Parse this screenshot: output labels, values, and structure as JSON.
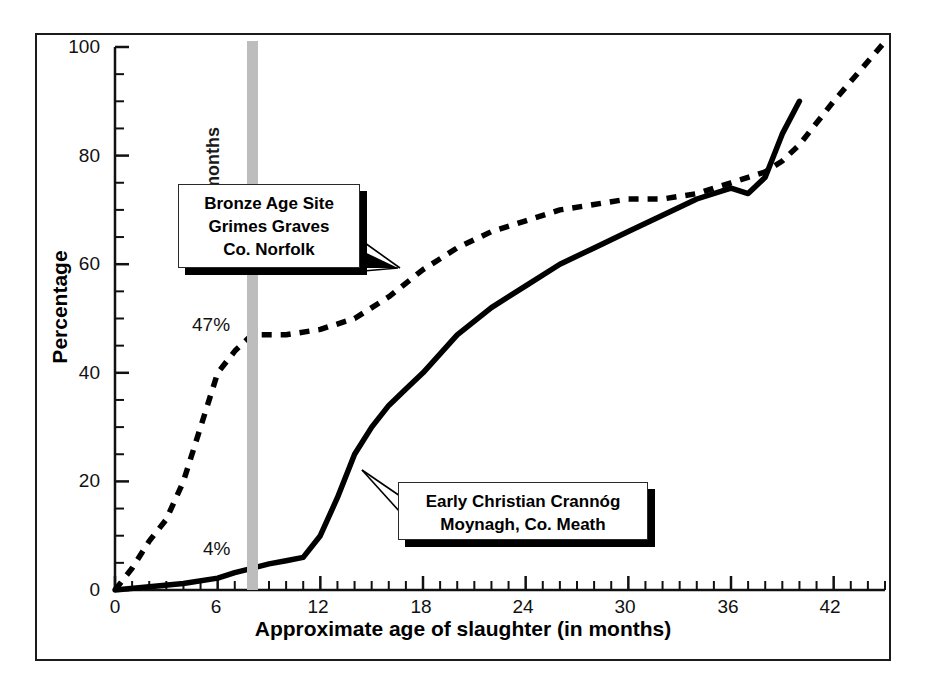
{
  "chart_data": {
    "type": "line",
    "title": "",
    "xlabel": "Approximate age of slaughter (in months)",
    "ylabel": "Percentage",
    "xlim": [
      0,
      45
    ],
    "ylim": [
      0,
      100
    ],
    "xticks": [
      0,
      6,
      12,
      18,
      24,
      30,
      36,
      42
    ],
    "xtick_labels": [
      "0",
      "6",
      "12",
      "18",
      "24",
      "30",
      "36",
      "42"
    ],
    "x_minor_tick_interval": 1,
    "yticks": [
      0,
      20,
      40,
      60,
      80,
      100
    ],
    "ytick_labels": [
      "0",
      "20",
      "40",
      "60",
      "80",
      "100"
    ],
    "y_minor_tick_interval": 5,
    "grid": false,
    "legend_position": "none",
    "series": [
      {
        "name": "Bronze Age Site Grimes Graves Co. Norfolk",
        "style": "dashed",
        "color": "#000000",
        "x": [
          0,
          1,
          2,
          3,
          4,
          5,
          6,
          7,
          8,
          10,
          12,
          14,
          16,
          18,
          20,
          22,
          24,
          26,
          28,
          30,
          32,
          34,
          36,
          37,
          38,
          39,
          40,
          42,
          45
        ],
        "y": [
          0,
          4,
          9,
          13,
          20,
          30,
          40,
          44,
          47,
          47,
          48,
          50,
          54,
          59,
          63,
          66,
          68,
          70,
          71,
          72,
          72,
          73,
          75,
          76,
          77,
          79,
          82,
          90,
          101
        ]
      },
      {
        "name": "Early Christian Crannóg Moynagh, Co. Meath",
        "style": "solid",
        "color": "#000000",
        "x": [
          0,
          2,
          4,
          6,
          7,
          8,
          9,
          10,
          11,
          12,
          13,
          14,
          15,
          16,
          17,
          18,
          20,
          22,
          24,
          26,
          28,
          30,
          32,
          34,
          36,
          37,
          38,
          39,
          40
        ],
        "y": [
          0,
          0.6,
          1.2,
          2.2,
          3.2,
          4,
          4.8,
          5.4,
          6,
          10,
          17,
          25,
          30,
          34,
          37,
          40,
          47,
          52,
          56,
          60,
          63,
          66,
          69,
          72,
          74,
          73,
          76,
          84,
          90
        ]
      }
    ],
    "annotations": [
      {
        "id": "pct-47",
        "text": "47%",
        "x": 7.0,
        "y": 51.5,
        "note": "Grimes Graves value at 8 months"
      },
      {
        "id": "pct-4",
        "text": "4%",
        "x": 6.2,
        "y": 10.0,
        "note": "Moynagh value at 8 months"
      },
      {
        "id": "band-label",
        "text": "8 months",
        "x": 8,
        "note": "rotated label on grey vertical band"
      }
    ],
    "reference_band": {
      "label": "8 months",
      "x_value": 8,
      "color": "#bdbdbd"
    }
  },
  "axes": {
    "x_title": "Approximate age of slaughter (in months)",
    "y_title": "Percentage",
    "x_ticks": [
      "0",
      "6",
      "12",
      "18",
      "24",
      "30",
      "36",
      "42"
    ],
    "y_ticks": [
      "100",
      "80",
      "60",
      "40",
      "20",
      "0"
    ]
  },
  "callouts": {
    "bronze": {
      "line1": "Bronze Age Site",
      "line2": "Grimes Graves",
      "line3": "Co. Norfolk"
    },
    "crannog": {
      "line1": "Early Christian Crannóg",
      "line2": "Moynagh, Co. Meath"
    }
  },
  "annotations": {
    "band_label": "8 months",
    "pct_grimes": "47%",
    "pct_moynagh": "4%"
  },
  "colors": {
    "band": "#bdbdbd",
    "ink": "#000000",
    "frame": "#1b1b1b"
  }
}
